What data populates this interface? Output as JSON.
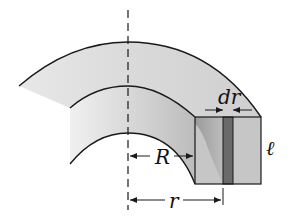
{
  "figure": {
    "type": "cylindrical shell cross-section diagram",
    "labels": {
      "inner_radius": "R",
      "shell_radius": "r",
      "shell_thickness": "dr",
      "length": "ℓ"
    },
    "colors": {
      "background": "#ffffff",
      "body_fill": "#d6d6d6",
      "body_shade_light": "#e4e4e4",
      "face_fill": "#c4c4c4",
      "face_shadow": "#8e8e8e",
      "strip_fill": "#6a6a6a",
      "stroke": "#1a1a1a"
    }
  }
}
